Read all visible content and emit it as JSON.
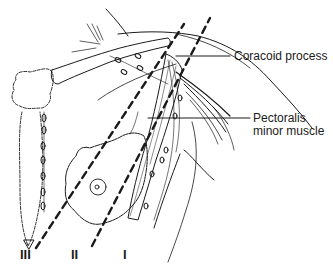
{
  "diagram": {
    "labels": {
      "coracoid": "Coracoid process",
      "pectoralis_line1": "Pectoralis",
      "pectoralis_line2": "minor muscle"
    },
    "levels": [
      {
        "id": "level-3",
        "label": "III"
      },
      {
        "id": "level-2",
        "label": "II"
      },
      {
        "id": "level-1",
        "label": "I"
      }
    ],
    "colors": {
      "ink": "#1a1a1a",
      "background": "#ffffff"
    }
  }
}
